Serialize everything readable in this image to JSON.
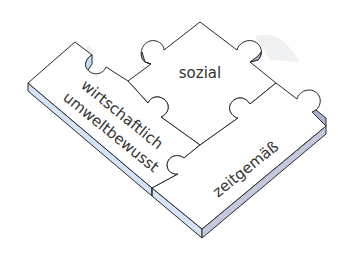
{
  "diagram": {
    "type": "puzzle",
    "pieces": [
      {
        "id": "left",
        "lines": [
          "wirtschaftlich",
          "umweltbewusst"
        ]
      },
      {
        "id": "top",
        "lines": [
          "sozial"
        ]
      },
      {
        "id": "right",
        "lines": [
          "zeitgemäß"
        ]
      }
    ],
    "colors": {
      "piece_face": "#ffffff",
      "edge_light": "#d4e3f5",
      "edge_dark": "#c3c9dd",
      "outline": "#2a2a2a",
      "text": "#333333"
    }
  }
}
